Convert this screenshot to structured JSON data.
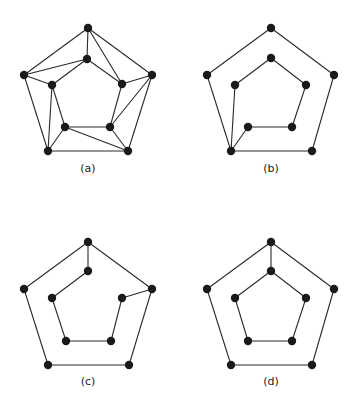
{
  "figure": {
    "node_color": "#1a1a1a",
    "edge_color": "#2a2a2a",
    "node_radius": 4.2,
    "panels": [
      {
        "id": "a",
        "label": "(a)",
        "label_pos": [
          88,
          172
        ],
        "nodes": {
          "ot": [
            88,
            28
          ],
          "ol": [
            24,
            75
          ],
          "or": [
            152,
            75
          ],
          "obl": [
            48,
            151
          ],
          "obr": [
            128,
            151
          ],
          "it": [
            87,
            59
          ],
          "il": [
            52,
            85
          ],
          "ir": [
            122,
            84
          ],
          "ibl": [
            65,
            127
          ],
          "ibr": [
            110,
            127
          ]
        },
        "edges": [
          [
            "ot",
            "ol"
          ],
          [
            "ot",
            "or"
          ],
          [
            "or",
            "obr"
          ],
          [
            "obr",
            "obl"
          ],
          [
            "obl",
            "ol"
          ],
          [
            "ot",
            "it"
          ],
          [
            "ot",
            "ir"
          ],
          [
            "ol",
            "it"
          ],
          [
            "ol",
            "il"
          ],
          [
            "or",
            "ir"
          ],
          [
            "or",
            "ibr"
          ],
          [
            "it",
            "il"
          ],
          [
            "it",
            "ir"
          ],
          [
            "il",
            "ibl"
          ],
          [
            "il",
            "obl"
          ],
          [
            "ibl",
            "ibr"
          ],
          [
            "ibl",
            "obl"
          ],
          [
            "ibl",
            "obr"
          ],
          [
            "ibr",
            "ir"
          ],
          [
            "ibr",
            "obr"
          ]
        ]
      },
      {
        "id": "b",
        "label": "(b)",
        "label_pos": [
          271,
          172
        ],
        "nodes": {
          "ot": [
            271,
            28
          ],
          "ol": [
            207,
            75
          ],
          "or": [
            334,
            75
          ],
          "obl": [
            231,
            151
          ],
          "obr": [
            312,
            151
          ],
          "it": [
            271,
            58
          ],
          "il": [
            235,
            85
          ],
          "ir": [
            306,
            85
          ],
          "ibl": [
            248,
            127
          ],
          "ibr": [
            292,
            127
          ]
        },
        "edges": [
          [
            "ot",
            "ol"
          ],
          [
            "ot",
            "or"
          ],
          [
            "or",
            "obr"
          ],
          [
            "obr",
            "obl"
          ],
          [
            "obl",
            "ol"
          ],
          [
            "it",
            "il"
          ],
          [
            "it",
            "ir"
          ],
          [
            "ir",
            "ibr"
          ],
          [
            "ibr",
            "ibl"
          ],
          [
            "ibl",
            "obl"
          ],
          [
            "il",
            "obl"
          ]
        ]
      },
      {
        "id": "c",
        "label": "(c)",
        "label_pos": [
          88,
          385
        ],
        "nodes": {
          "ot": [
            88,
            242
          ],
          "ol": [
            24,
            289
          ],
          "or": [
            152,
            289
          ],
          "obl": [
            48,
            365
          ],
          "obr": [
            129,
            365
          ],
          "it": [
            88,
            271
          ],
          "il": [
            52,
            298
          ],
          "ir": [
            122,
            298
          ],
          "ibl": [
            66,
            341
          ],
          "ibr": [
            111,
            341
          ]
        },
        "edges": [
          [
            "ot",
            "ol"
          ],
          [
            "ot",
            "or"
          ],
          [
            "or",
            "obr"
          ],
          [
            "obr",
            "obl"
          ],
          [
            "obl",
            "ol"
          ],
          [
            "ot",
            "it"
          ],
          [
            "it",
            "il"
          ],
          [
            "il",
            "ibl"
          ],
          [
            "ibl",
            "ibr"
          ],
          [
            "ibr",
            "ir"
          ],
          [
            "ir",
            "or"
          ]
        ]
      },
      {
        "id": "d",
        "label": "(d)",
        "label_pos": [
          271,
          385
        ],
        "nodes": {
          "ot": [
            271,
            242
          ],
          "ol": [
            207,
            289
          ],
          "or": [
            334,
            289
          ],
          "obl": [
            231,
            365
          ],
          "obr": [
            312,
            365
          ],
          "it": [
            271,
            271
          ],
          "il": [
            235,
            298
          ],
          "ir": [
            306,
            298
          ],
          "ibl": [
            248,
            341
          ],
          "ibr": [
            292,
            341
          ]
        },
        "edges": [
          [
            "ot",
            "ol"
          ],
          [
            "ot",
            "or"
          ],
          [
            "or",
            "obr"
          ],
          [
            "obr",
            "obl"
          ],
          [
            "obl",
            "ol"
          ],
          [
            "it",
            "il"
          ],
          [
            "it",
            "ir"
          ],
          [
            "ir",
            "ibr"
          ],
          [
            "ibr",
            "ibl"
          ],
          [
            "ibl",
            "il"
          ],
          [
            "ot",
            "it"
          ]
        ]
      }
    ]
  }
}
